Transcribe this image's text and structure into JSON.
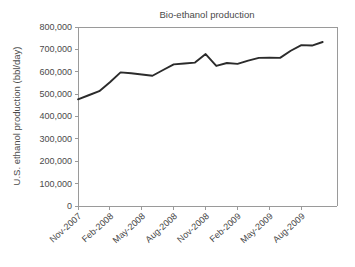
{
  "chart_data": {
    "type": "line",
    "title": "Bio-ethanol production",
    "xlabel": "",
    "ylabel": "U.S. ethanol production (bbl/day)",
    "ylim": [
      0,
      800000
    ],
    "yticks": [
      "0",
      "100,000",
      "200,000",
      "300,000",
      "400,000",
      "500,000",
      "600,000",
      "700,000",
      "800,000"
    ],
    "ytick_values": [
      0,
      100000,
      200000,
      300000,
      400000,
      500000,
      600000,
      700000,
      800000
    ],
    "xtick_labels": [
      "Nov-2007",
      "Feb-2008",
      "May-2008",
      "Aug-2008",
      "Nov-2008",
      "Feb-2009",
      "May-2009",
      "Aug-2009"
    ],
    "xtick_indices": [
      0,
      3,
      6,
      9,
      12,
      15,
      18,
      21
    ],
    "grid": false,
    "legend": false,
    "x": [
      "Nov-2007",
      "Dec-2007",
      "Jan-2008",
      "Feb-2008",
      "Mar-2008",
      "Apr-2008",
      "May-2008",
      "Jun-2008",
      "Jul-2008",
      "Aug-2008",
      "Sep-2008",
      "Oct-2008",
      "Nov-2008",
      "Dec-2008",
      "Jan-2009",
      "Feb-2009",
      "Mar-2009",
      "Apr-2009",
      "May-2009",
      "Jun-2009",
      "Jul-2009",
      "Aug-2009",
      "Sep-2009",
      "Oct-2009"
    ],
    "values": [
      477000,
      495000,
      513000,
      553000,
      597000,
      593000,
      588000,
      582000,
      608000,
      633000,
      637000,
      641000,
      679000,
      626000,
      639000,
      635000,
      650000,
      662000,
      663000,
      662000,
      694000,
      719000,
      717000,
      733000
    ],
    "line_color": "#2b2b2b",
    "axis_color": "#9a9a9a"
  },
  "layout": {
    "plot_left": 78,
    "plot_right": 337,
    "plot_top": 27,
    "plot_bottom": 206
  }
}
